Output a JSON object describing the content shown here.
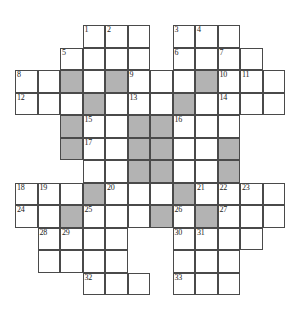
{
  "puzzle": {
    "type": "crossword-grid",
    "rows": 12,
    "cols": 12,
    "cell_size_px": 22.5,
    "colors": {
      "background": "#ffffff",
      "cell_fill": "#ffffff",
      "block_fill": "#b3b3b3",
      "grid_line": "#4a4a4a",
      "number_text": "#1a1a1a"
    },
    "cells": [
      {
        "r": 0,
        "c": 3,
        "state": "open",
        "num": "1"
      },
      {
        "r": 0,
        "c": 4,
        "state": "open",
        "num": "2"
      },
      {
        "r": 0,
        "c": 5,
        "state": "open",
        "num": ""
      },
      {
        "r": 0,
        "c": 7,
        "state": "open",
        "num": "3"
      },
      {
        "r": 0,
        "c": 8,
        "state": "open",
        "num": "4"
      },
      {
        "r": 0,
        "c": 9,
        "state": "open",
        "num": ""
      },
      {
        "r": 1,
        "c": 2,
        "state": "open",
        "num": "5"
      },
      {
        "r": 1,
        "c": 3,
        "state": "open",
        "num": ""
      },
      {
        "r": 1,
        "c": 4,
        "state": "open",
        "num": ""
      },
      {
        "r": 1,
        "c": 5,
        "state": "open",
        "num": ""
      },
      {
        "r": 1,
        "c": 7,
        "state": "open",
        "num": "6"
      },
      {
        "r": 1,
        "c": 8,
        "state": "open",
        "num": ""
      },
      {
        "r": 1,
        "c": 9,
        "state": "open",
        "num": "7"
      },
      {
        "r": 1,
        "c": 10,
        "state": "open",
        "num": ""
      },
      {
        "r": 2,
        "c": 0,
        "state": "open",
        "num": "8"
      },
      {
        "r": 2,
        "c": 1,
        "state": "open",
        "num": ""
      },
      {
        "r": 2,
        "c": 2,
        "state": "block",
        "num": ""
      },
      {
        "r": 2,
        "c": 3,
        "state": "open",
        "num": ""
      },
      {
        "r": 2,
        "c": 4,
        "state": "block",
        "num": ""
      },
      {
        "r": 2,
        "c": 5,
        "state": "open",
        "num": "9"
      },
      {
        "r": 2,
        "c": 6,
        "state": "open",
        "num": ""
      },
      {
        "r": 2,
        "c": 7,
        "state": "open",
        "num": ""
      },
      {
        "r": 2,
        "c": 8,
        "state": "block",
        "num": ""
      },
      {
        "r": 2,
        "c": 9,
        "state": "open",
        "num": "10"
      },
      {
        "r": 2,
        "c": 10,
        "state": "open",
        "num": "11"
      },
      {
        "r": 2,
        "c": 11,
        "state": "open",
        "num": ""
      },
      {
        "r": 3,
        "c": 0,
        "state": "open",
        "num": "12"
      },
      {
        "r": 3,
        "c": 1,
        "state": "open",
        "num": ""
      },
      {
        "r": 3,
        "c": 2,
        "state": "open",
        "num": ""
      },
      {
        "r": 3,
        "c": 3,
        "state": "block",
        "num": ""
      },
      {
        "r": 3,
        "c": 4,
        "state": "open",
        "num": ""
      },
      {
        "r": 3,
        "c": 5,
        "state": "open",
        "num": "13"
      },
      {
        "r": 3,
        "c": 6,
        "state": "open",
        "num": ""
      },
      {
        "r": 3,
        "c": 7,
        "state": "block",
        "num": ""
      },
      {
        "r": 3,
        "c": 8,
        "state": "open",
        "num": ""
      },
      {
        "r": 3,
        "c": 9,
        "state": "open",
        "num": "14"
      },
      {
        "r": 3,
        "c": 10,
        "state": "open",
        "num": ""
      },
      {
        "r": 3,
        "c": 11,
        "state": "open",
        "num": ""
      },
      {
        "r": 4,
        "c": 2,
        "state": "block",
        "num": ""
      },
      {
        "r": 4,
        "c": 3,
        "state": "open",
        "num": "15"
      },
      {
        "r": 4,
        "c": 4,
        "state": "open",
        "num": ""
      },
      {
        "r": 4,
        "c": 5,
        "state": "block",
        "num": ""
      },
      {
        "r": 4,
        "c": 6,
        "state": "block",
        "num": ""
      },
      {
        "r": 4,
        "c": 7,
        "state": "open",
        "num": "16"
      },
      {
        "r": 4,
        "c": 8,
        "state": "open",
        "num": ""
      },
      {
        "r": 4,
        "c": 9,
        "state": "open",
        "num": ""
      },
      {
        "r": 5,
        "c": 2,
        "state": "block",
        "num": ""
      },
      {
        "r": 5,
        "c": 3,
        "state": "open",
        "num": "17"
      },
      {
        "r": 5,
        "c": 4,
        "state": "open",
        "num": ""
      },
      {
        "r": 5,
        "c": 5,
        "state": "block",
        "num": ""
      },
      {
        "r": 5,
        "c": 6,
        "state": "block",
        "num": ""
      },
      {
        "r": 5,
        "c": 7,
        "state": "open",
        "num": ""
      },
      {
        "r": 5,
        "c": 8,
        "state": "open",
        "num": ""
      },
      {
        "r": 5,
        "c": 9,
        "state": "block",
        "num": ""
      },
      {
        "r": 6,
        "c": 3,
        "state": "open",
        "num": ""
      },
      {
        "r": 6,
        "c": 4,
        "state": "open",
        "num": ""
      },
      {
        "r": 6,
        "c": 5,
        "state": "block",
        "num": ""
      },
      {
        "r": 6,
        "c": 6,
        "state": "block",
        "num": ""
      },
      {
        "r": 6,
        "c": 7,
        "state": "open",
        "num": ""
      },
      {
        "r": 6,
        "c": 8,
        "state": "open",
        "num": ""
      },
      {
        "r": 6,
        "c": 9,
        "state": "block",
        "num": ""
      },
      {
        "r": 7,
        "c": 0,
        "state": "open",
        "num": "18"
      },
      {
        "r": 7,
        "c": 1,
        "state": "open",
        "num": "19"
      },
      {
        "r": 7,
        "c": 2,
        "state": "open",
        "num": ""
      },
      {
        "r": 7,
        "c": 3,
        "state": "block",
        "num": ""
      },
      {
        "r": 7,
        "c": 4,
        "state": "open",
        "num": "20"
      },
      {
        "r": 7,
        "c": 5,
        "state": "open",
        "num": ""
      },
      {
        "r": 7,
        "c": 6,
        "state": "open",
        "num": ""
      },
      {
        "r": 7,
        "c": 7,
        "state": "block",
        "num": ""
      },
      {
        "r": 7,
        "c": 8,
        "state": "open",
        "num": "21"
      },
      {
        "r": 7,
        "c": 9,
        "state": "open",
        "num": "22"
      },
      {
        "r": 7,
        "c": 10,
        "state": "open",
        "num": "23"
      },
      {
        "r": 7,
        "c": 11,
        "state": "open",
        "num": ""
      },
      {
        "r": 8,
        "c": 0,
        "state": "open",
        "num": "24"
      },
      {
        "r": 8,
        "c": 1,
        "state": "open",
        "num": ""
      },
      {
        "r": 8,
        "c": 2,
        "state": "block",
        "num": ""
      },
      {
        "r": 8,
        "c": 3,
        "state": "open",
        "num": "25"
      },
      {
        "r": 8,
        "c": 4,
        "state": "open",
        "num": ""
      },
      {
        "r": 8,
        "c": 5,
        "state": "open",
        "num": ""
      },
      {
        "r": 8,
        "c": 6,
        "state": "block",
        "num": ""
      },
      {
        "r": 8,
        "c": 7,
        "state": "open",
        "num": "26"
      },
      {
        "r": 8,
        "c": 8,
        "state": "block",
        "num": ""
      },
      {
        "r": 8,
        "c": 9,
        "state": "open",
        "num": "27"
      },
      {
        "r": 8,
        "c": 10,
        "state": "open",
        "num": ""
      },
      {
        "r": 8,
        "c": 11,
        "state": "open",
        "num": ""
      },
      {
        "r": 9,
        "c": 1,
        "state": "open",
        "num": "28"
      },
      {
        "r": 9,
        "c": 2,
        "state": "open",
        "num": "29"
      },
      {
        "r": 9,
        "c": 3,
        "state": "open",
        "num": ""
      },
      {
        "r": 9,
        "c": 4,
        "state": "open",
        "num": ""
      },
      {
        "r": 9,
        "c": 7,
        "state": "open",
        "num": "30"
      },
      {
        "r": 9,
        "c": 8,
        "state": "open",
        "num": "31"
      },
      {
        "r": 9,
        "c": 9,
        "state": "open",
        "num": ""
      },
      {
        "r": 9,
        "c": 10,
        "state": "open",
        "num": ""
      },
      {
        "r": 10,
        "c": 1,
        "state": "open",
        "num": ""
      },
      {
        "r": 10,
        "c": 2,
        "state": "open",
        "num": ""
      },
      {
        "r": 10,
        "c": 3,
        "state": "open",
        "num": ""
      },
      {
        "r": 10,
        "c": 4,
        "state": "open",
        "num": ""
      },
      {
        "r": 10,
        "c": 7,
        "state": "open",
        "num": ""
      },
      {
        "r": 10,
        "c": 8,
        "state": "open",
        "num": ""
      },
      {
        "r": 10,
        "c": 9,
        "state": "open",
        "num": ""
      },
      {
        "r": 11,
        "c": 3,
        "state": "open",
        "num": "32"
      },
      {
        "r": 11,
        "c": 4,
        "state": "open",
        "num": ""
      },
      {
        "r": 11,
        "c": 5,
        "state": "open",
        "num": ""
      },
      {
        "r": 11,
        "c": 7,
        "state": "open",
        "num": "33"
      },
      {
        "r": 11,
        "c": 8,
        "state": "open",
        "num": ""
      },
      {
        "r": 11,
        "c": 9,
        "state": "open",
        "num": ""
      }
    ]
  }
}
